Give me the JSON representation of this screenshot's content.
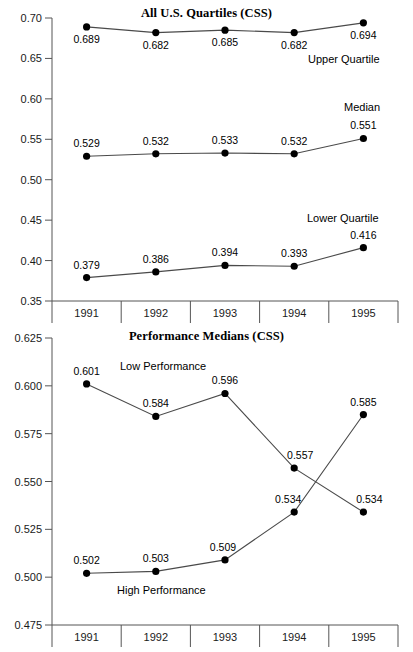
{
  "page": {
    "width": 413,
    "height": 652,
    "background": "#ffffff",
    "ink": "#000000",
    "line_color": "#4a4a4a",
    "axis_color": "#555555"
  },
  "chart_data": [
    {
      "id": "all-us-quartiles",
      "type": "line",
      "title": "All U.S. Quartiles (CSS)",
      "xlabel": "",
      "ylabel": "",
      "categories": [
        "1991",
        "1992",
        "1993",
        "1994",
        "1995"
      ],
      "ylim": [
        0.35,
        0.7
      ],
      "yticks": [
        0.7,
        0.65,
        0.6,
        0.55,
        0.5,
        0.45,
        0.4,
        0.35
      ],
      "ytick_labels": [
        "0.70",
        "0.65",
        "0.60",
        "0.55",
        "0.50",
        "0.45",
        "0.40",
        "0.35"
      ],
      "grid": false,
      "legend_position": "inline-annotations",
      "series": [
        {
          "name": "Upper Quartile",
          "values": [
            0.689,
            0.682,
            0.685,
            0.682,
            0.694
          ],
          "data_labels": [
            "0.689",
            "0.682",
            "0.685",
            "0.682",
            "0.694"
          ],
          "annotation": "Upper Quartile"
        },
        {
          "name": "Median",
          "values": [
            0.529,
            0.532,
            0.533,
            0.532,
            0.551
          ],
          "data_labels": [
            "0.529",
            "0.532",
            "0.533",
            "0.532",
            "0.551"
          ],
          "annotation": "Median"
        },
        {
          "name": "Lower Quartile",
          "values": [
            0.379,
            0.386,
            0.394,
            0.393,
            0.416
          ],
          "data_labels": [
            "0.379",
            "0.386",
            "0.394",
            "0.393",
            "0.416"
          ],
          "annotation": "Lower Quartile"
        }
      ]
    },
    {
      "id": "performance-medians",
      "type": "line",
      "title": "Performance Medians (CSS)",
      "xlabel": "",
      "ylabel": "",
      "categories": [
        "1991",
        "1992",
        "1993",
        "1994",
        "1995"
      ],
      "ylim": [
        0.475,
        0.625
      ],
      "yticks": [
        0.625,
        0.6,
        0.575,
        0.55,
        0.525,
        0.5,
        0.475
      ],
      "ytick_labels": [
        "0.625",
        "0.600",
        "0.575",
        "0.550",
        "0.525",
        "0.500",
        "0.475"
      ],
      "grid": false,
      "legend_position": "inline-annotations",
      "series": [
        {
          "name": "Low Performance",
          "values": [
            0.601,
            0.584,
            0.596,
            0.557,
            0.534
          ],
          "data_labels": [
            "0.601",
            "0.584",
            "0.596",
            "0.557",
            "0.534"
          ],
          "annotation": "Low Performance"
        },
        {
          "name": "High Performance",
          "values": [
            0.502,
            0.503,
            0.509,
            0.534,
            0.585
          ],
          "data_labels": [
            "0.502",
            "0.503",
            "0.509",
            "0.534",
            "0.585"
          ],
          "annotation": "High Performance"
        }
      ]
    }
  ]
}
